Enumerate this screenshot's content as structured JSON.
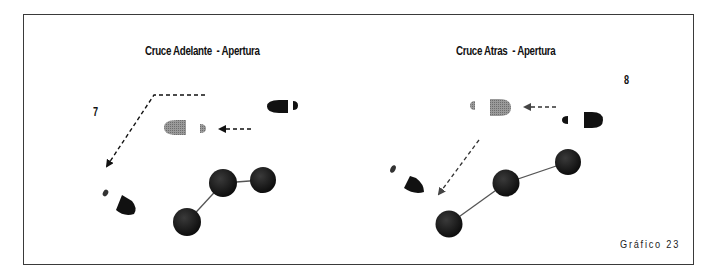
{
  "figure": {
    "caption": "Gráfico 23",
    "frame_color": "#3a3a3a"
  },
  "panels": [
    {
      "id": "left",
      "title": "Cruce Adelante  - Apertura",
      "number": "7",
      "players": [
        {
          "cx": 187,
          "cy": 222,
          "r": 14
        },
        {
          "cx": 223,
          "cy": 183,
          "r": 14
        },
        {
          "cx": 263,
          "cy": 180,
          "r": 13
        }
      ],
      "footprints": [
        {
          "role": "start",
          "shade": "black"
        },
        {
          "role": "intermediate",
          "shade": "gray"
        },
        {
          "role": "end",
          "shade": "black"
        }
      ],
      "arrows": [
        "dashed-path-down-left",
        "dashed-short-left"
      ]
    },
    {
      "id": "right",
      "title": "Cruce Atras  - Apertura",
      "number": "8",
      "players": [
        {
          "cx": 449,
          "cy": 224,
          "r": 13
        },
        {
          "cx": 506,
          "cy": 183,
          "r": 13
        },
        {
          "cx": 568,
          "cy": 162,
          "r": 13
        }
      ],
      "footprints": [
        {
          "role": "start",
          "shade": "black"
        },
        {
          "role": "intermediate",
          "shade": "gray"
        },
        {
          "role": "end",
          "shade": "black"
        }
      ],
      "arrows": [
        "dashed-short-left",
        "dashed-diagonal-down-left"
      ]
    }
  ],
  "colors": {
    "ink": "#111111",
    "gray_foot": "#8a8a8a",
    "line": "#555555"
  }
}
